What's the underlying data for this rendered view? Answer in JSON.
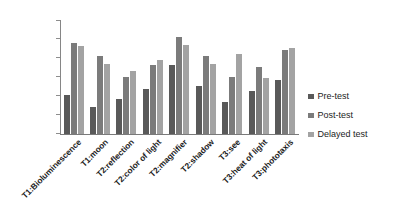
{
  "chart_data": {
    "type": "bar",
    "title": "",
    "xlabel": "",
    "ylabel": "",
    "ylim": [
      0,
      3
    ],
    "ytick_labels": [
      "3",
      "2.5",
      "2",
      "1.5",
      "1",
      "0.5",
      "0"
    ],
    "ytick_values": [
      3,
      2.5,
      2,
      1.5,
      1,
      0.5,
      0
    ],
    "grid": false,
    "legend_position": "right",
    "categories": [
      "T1:Bioluminescence",
      "T1:moon",
      "T2:reflection",
      "T2:color of light",
      "T2:magnifier",
      "T2:shadow",
      "T3:see",
      "T3:heat of light",
      "T3:phototaxis"
    ],
    "series": [
      {
        "name": "Pre-test",
        "color": "#595959",
        "values": [
          1.02,
          0.72,
          0.92,
          1.18,
          1.82,
          1.27,
          0.84,
          1.13,
          1.43
        ]
      },
      {
        "name": "Post-test",
        "color": "#7b7b7b",
        "values": [
          2.41,
          2.05,
          1.51,
          1.82,
          2.57,
          2.05,
          1.52,
          1.78,
          2.23
        ]
      },
      {
        "name": "Delayed test",
        "color": "#a3a3a3",
        "values": [
          2.32,
          1.85,
          1.66,
          1.96,
          2.36,
          1.84,
          2.12,
          1.49,
          2.28
        ]
      }
    ]
  },
  "legend": {
    "items": [
      {
        "label": "Pre-test"
      },
      {
        "label": "Post-test"
      },
      {
        "label": "Delayed test"
      }
    ]
  },
  "caption": {
    "text": ""
  }
}
